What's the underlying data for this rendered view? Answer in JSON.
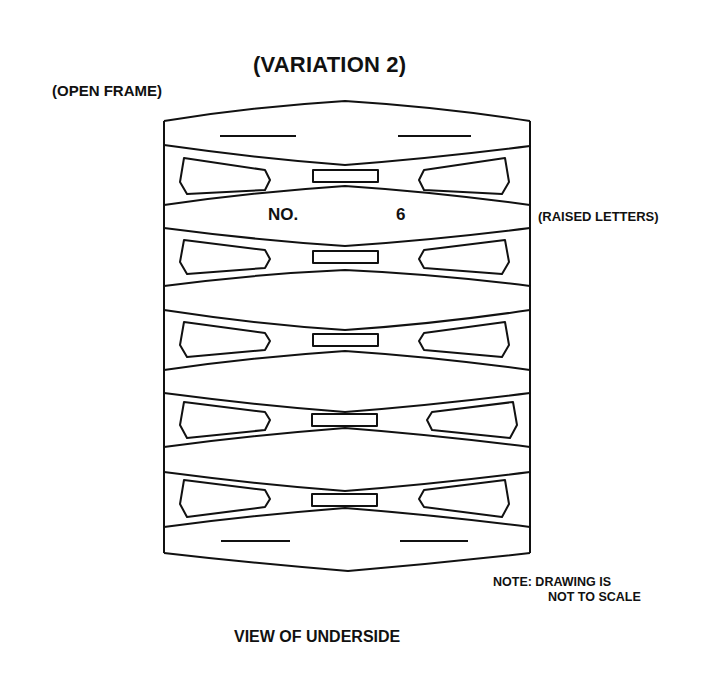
{
  "diagram": {
    "title": "(VARIATION 2)",
    "subtitle": "(OPEN FRAME)",
    "callout": "(RAISED LETTERS)",
    "raised_text": {
      "left": "NO.",
      "right": "6"
    },
    "note": {
      "line1": "NOTE: DRAWING IS",
      "line2": "NOT TO SCALE"
    },
    "footer": "VIEW OF UNDERSIDE",
    "structure": {
      "rows": 5,
      "elements_per_row": [
        "left-pocket",
        "center-slot",
        "right-pocket"
      ],
      "end_caps": [
        "top-cap",
        "bottom-cap"
      ]
    },
    "colors": {
      "line": "#111111",
      "background": "#ffffff"
    }
  }
}
